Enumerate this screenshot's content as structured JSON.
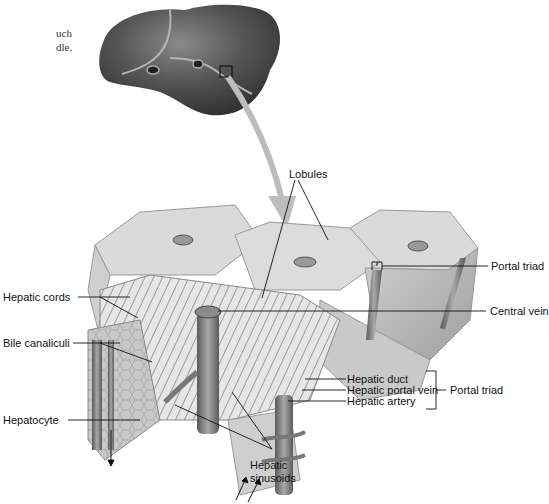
{
  "caption": {
    "line1": "uch",
    "line2": "dle."
  },
  "labels": {
    "lobules": "Lobules",
    "portal_triad_top": "Portal triad",
    "central_vein": "Central vein",
    "hepatic_cords": "Hepatic cords",
    "bile_canaliculi": "Bile canaliculi",
    "hepatocyte": "Hepatocyte",
    "hepatic_duct": "Hepatic duct",
    "hepatic_portal_vein": "Hepatic portal vein",
    "hepatic_artery": "Hepatic artery",
    "portal_triad_group": "Portal triad",
    "hepatic_sinusoids_1": "Hepatic",
    "hepatic_sinusoids_2": "sinusoids"
  },
  "colors": {
    "liver": "#4a4a4a",
    "lobule_face": "#d9d9d9",
    "lobule_side": "#bdbdbd",
    "arrow": "#bfbfbf",
    "vessel": "#7a7a7a",
    "leader_line": "#111111"
  }
}
